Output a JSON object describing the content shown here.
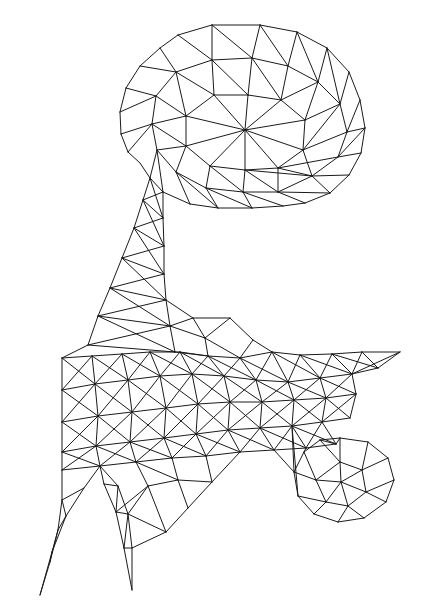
{
  "figure": {
    "domain": "diagram",
    "background_color": "#ffffff",
    "line_color": "#1a1a1a",
    "line_width": 1,
    "width": 422,
    "height": 606
  },
  "chart_data": {
    "type": "mesh",
    "xlabel": "",
    "ylabel": "",
    "xlim": [
      0,
      422
    ],
    "ylim": [
      0,
      606
    ],
    "grid": false,
    "legend": null,
    "vertex_count": 150,
    "vertices": [
      [
        212,
        25
      ],
      [
        260,
        25
      ],
      [
        178,
        35
      ],
      [
        297,
        32
      ],
      [
        150,
        55
      ],
      [
        327,
        48
      ],
      [
        130,
        78
      ],
      [
        349,
        72
      ],
      [
        121,
        105
      ],
      [
        360,
        100
      ],
      [
        120,
        128
      ],
      [
        365,
        128
      ],
      [
        128,
        152
      ],
      [
        361,
        153
      ],
      [
        143,
        175
      ],
      [
        349,
        175
      ],
      [
        163,
        192
      ],
      [
        330,
        193
      ],
      [
        190,
        204
      ],
      [
        305,
        203
      ],
      [
        218,
        208
      ],
      [
        252,
        208
      ],
      [
        283,
        206
      ],
      [
        164,
        57
      ],
      [
        209,
        62
      ],
      [
        248,
        60
      ],
      [
        287,
        68
      ],
      [
        318,
        80
      ],
      [
        152,
        92
      ],
      [
        196,
        96
      ],
      [
        240,
        95
      ],
      [
        281,
        97
      ],
      [
        316,
        106
      ],
      [
        344,
        104
      ],
      [
        154,
        126
      ],
      [
        200,
        128
      ],
      [
        245,
        126
      ],
      [
        283,
        130
      ],
      [
        318,
        133
      ],
      [
        347,
        132
      ],
      [
        160,
        155
      ],
      [
        203,
        158
      ],
      [
        245,
        156
      ],
      [
        284,
        158
      ],
      [
        312,
        160
      ],
      [
        338,
        156
      ],
      [
        195,
        180
      ],
      [
        238,
        182
      ],
      [
        275,
        180
      ],
      [
        305,
        178
      ],
      [
        155,
        200
      ],
      [
        160,
        222
      ],
      [
        165,
        245
      ],
      [
        163,
        268
      ],
      [
        140,
        228
      ],
      [
        128,
        255
      ],
      [
        115,
        283
      ],
      [
        103,
        310
      ],
      [
        155,
        290
      ],
      [
        148,
        312
      ],
      [
        140,
        338
      ],
      [
        118,
        298
      ],
      [
        96,
        318
      ],
      [
        88,
        345
      ],
      [
        178,
        300
      ],
      [
        193,
        318
      ],
      [
        205,
        338
      ],
      [
        230,
        318
      ],
      [
        253,
        340
      ],
      [
        272,
        352
      ],
      [
        175,
        352
      ],
      [
        208,
        355
      ],
      [
        240,
        358
      ],
      [
        62,
        358
      ],
      [
        62,
        390
      ],
      [
        62,
        422
      ],
      [
        62,
        455
      ],
      [
        90,
        355
      ],
      [
        120,
        352
      ],
      [
        148,
        350
      ],
      [
        95,
        382
      ],
      [
        128,
        378
      ],
      [
        160,
        375
      ],
      [
        100,
        408
      ],
      [
        133,
        405
      ],
      [
        165,
        402
      ],
      [
        196,
        400
      ],
      [
        92,
        432
      ],
      [
        125,
        428
      ],
      [
        158,
        425
      ],
      [
        190,
        422
      ],
      [
        222,
        420
      ],
      [
        105,
        462
      ],
      [
        140,
        458
      ],
      [
        175,
        455
      ],
      [
        210,
        452
      ],
      [
        245,
        450
      ],
      [
        300,
        355
      ],
      [
        340,
        352
      ],
      [
        370,
        350
      ],
      [
        400,
        352
      ],
      [
        300,
        378
      ],
      [
        332,
        374
      ],
      [
        362,
        370
      ],
      [
        292,
        398
      ],
      [
        322,
        394
      ],
      [
        352,
        390
      ],
      [
        286,
        420
      ],
      [
        316,
        416
      ],
      [
        348,
        412
      ],
      [
        268,
        400
      ],
      [
        255,
        420
      ],
      [
        240,
        440
      ],
      [
        275,
        440
      ],
      [
        305,
        438
      ],
      [
        335,
        435
      ],
      [
        258,
        462
      ],
      [
        288,
        460
      ],
      [
        318,
        458
      ],
      [
        330,
        440
      ],
      [
        358,
        438
      ],
      [
        380,
        452
      ],
      [
        392,
        470
      ],
      [
        395,
        492
      ],
      [
        382,
        512
      ],
      [
        358,
        525
      ],
      [
        330,
        528
      ],
      [
        306,
        518
      ],
      [
        292,
        498
      ],
      [
        292,
        472
      ],
      [
        340,
        465
      ],
      [
        360,
        480
      ],
      [
        345,
        495
      ],
      [
        318,
        492
      ],
      [
        352,
        505
      ],
      [
        320,
        512
      ],
      [
        62,
        482
      ],
      [
        78,
        500
      ],
      [
        95,
        520
      ],
      [
        55,
        545
      ],
      [
        47,
        575
      ],
      [
        40,
        595
      ],
      [
        125,
        492
      ],
      [
        138,
        515
      ],
      [
        120,
        540
      ],
      [
        130,
        565
      ],
      [
        132,
        590
      ],
      [
        240,
        470
      ],
      [
        210,
        482
      ],
      [
        180,
        478
      ],
      [
        205,
        505
      ],
      [
        182,
        528
      ]
    ]
  },
  "paths": {
    "outline": "M212,25 L260,25 L297,32 L327,48 L349,72 L360,100 L365,128 L361,153 L349,175 L330,193 L305,203 L283,206 L252,208 L218,208 L190,204 L163,192 L150,200 L147,230 L135,268 L120,305 L103,340 L88,352 L62,358 L62,455 L56,520 L40,595 L52,540 L72,500 L95,470 L112,490 L120,540 L132,590 L128,545 L140,505 L155,482 L175,478 L210,482 L240,470 L258,462 L288,460 L300,485 L306,518 L330,528 L358,525 L382,512 L395,492 L392,470 L380,452 L358,438 L330,440 L305,438 L310,415 L348,412 L362,395 L400,352 L370,350 L340,352 L300,355 L272,352 L253,340 L230,318 L205,338 L193,318 L178,300 L165,268 L163,245 L160,222 L155,200 L143,175 L128,152 L120,128 L121,105 L130,78 L150,55 L178,35 Z"
  },
  "edges": [
    [
      0,
      1
    ],
    [
      1,
      3
    ],
    [
      3,
      5
    ],
    [
      5,
      7
    ],
    [
      7,
      9
    ],
    [
      9,
      11
    ],
    [
      11,
      13
    ],
    [
      13,
      15
    ],
    [
      15,
      17
    ],
    [
      17,
      19
    ],
    [
      19,
      22
    ],
    [
      22,
      21
    ],
    [
      21,
      20
    ],
    [
      20,
      18
    ],
    [
      18,
      16
    ],
    [
      16,
      14
    ],
    [
      14,
      12
    ],
    [
      12,
      10
    ],
    [
      10,
      8
    ],
    [
      8,
      6
    ],
    [
      6,
      4
    ],
    [
      4,
      2
    ],
    [
      2,
      0
    ],
    [
      23,
      24
    ],
    [
      24,
      25
    ],
    [
      25,
      26
    ],
    [
      26,
      27
    ],
    [
      28,
      29
    ],
    [
      29,
      30
    ],
    [
      30,
      31
    ],
    [
      31,
      32
    ],
    [
      32,
      33
    ],
    [
      34,
      35
    ],
    [
      35,
      36
    ],
    [
      36,
      37
    ],
    [
      37,
      38
    ],
    [
      38,
      39
    ],
    [
      40,
      41
    ],
    [
      41,
      42
    ],
    [
      42,
      43
    ],
    [
      43,
      44
    ],
    [
      44,
      45
    ],
    [
      46,
      47
    ],
    [
      47,
      48
    ],
    [
      48,
      49
    ]
  ],
  "regions": [
    {
      "name": "head",
      "bbox": [
        118,
        24,
        248,
        185
      ]
    },
    {
      "name": "neck",
      "bbox": [
        88,
        185,
        90,
        175
      ]
    },
    {
      "name": "body",
      "bbox": [
        60,
        340,
        300,
        140
      ]
    },
    {
      "name": "tail",
      "bbox": [
        260,
        348,
        142,
        75
      ]
    },
    {
      "name": "front-leg",
      "bbox": [
        38,
        450,
        70,
        150
      ]
    },
    {
      "name": "hind-leg",
      "bbox": [
        110,
        450,
        80,
        150
      ]
    },
    {
      "name": "foot-ball",
      "bbox": [
        288,
        435,
        110,
        96
      ]
    }
  ]
}
